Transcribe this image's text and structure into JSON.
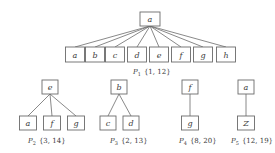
{
  "diagram": {
    "trees": [
      {
        "id": "P1",
        "name": "P",
        "subscript": "1",
        "interval": "{1, 12}",
        "root": "a",
        "children": [
          "a",
          "b",
          "c",
          "d",
          "e",
          "f",
          "g",
          "h"
        ]
      },
      {
        "id": "P2",
        "name": "P",
        "subscript": "2",
        "interval": "{3, 14}",
        "root": "e",
        "children": [
          "a",
          "f",
          "g"
        ]
      },
      {
        "id": "P3",
        "name": "P",
        "subscript": "3",
        "interval": "{2, 13}",
        "root": "b",
        "children": [
          "c",
          "d"
        ]
      },
      {
        "id": "P4",
        "name": "P",
        "subscript": "4",
        "interval": "{8, 20}",
        "root": "f",
        "children": [
          "g"
        ]
      },
      {
        "id": "P5",
        "name": "P",
        "subscript": "5",
        "interval": "{12, 19}",
        "root": "a",
        "children": [
          "Z"
        ]
      }
    ]
  }
}
